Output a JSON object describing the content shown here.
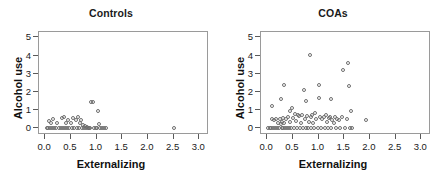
{
  "figure": {
    "background": "#ffffff",
    "marker_color": "#6e6e6e",
    "axis_color": "#9a9a9a"
  },
  "chart_data": [
    {
      "type": "scatter",
      "title": "Controls",
      "xlabel": "Externalizing",
      "ylabel": "Alcohol use",
      "xlim": [
        -0.12,
        3.15
      ],
      "ylim": [
        -0.28,
        5.3
      ],
      "xticks": [
        "0.0",
        "0.5",
        "1.0",
        "1.5",
        "2.0",
        "2.5",
        "3.0"
      ],
      "xtick_values": [
        0.0,
        0.5,
        1.0,
        1.5,
        2.0,
        2.5,
        3.0
      ],
      "yticks": [
        "0",
        "1",
        "2",
        "3",
        "4",
        "5"
      ],
      "ytick_values": [
        0,
        1,
        2,
        3,
        4,
        5
      ],
      "grid": false,
      "legend": "none",
      "marker": "open-circle",
      "points": [
        [
          0.03,
          0.0
        ],
        [
          0.06,
          0.0
        ],
        [
          0.08,
          0.4
        ],
        [
          0.09,
          0.0
        ],
        [
          0.12,
          0.3
        ],
        [
          0.14,
          0.0
        ],
        [
          0.16,
          0.52
        ],
        [
          0.18,
          0.0
        ],
        [
          0.21,
          0.0
        ],
        [
          0.24,
          0.3
        ],
        [
          0.26,
          0.0
        ],
        [
          0.3,
          0.0
        ],
        [
          0.32,
          0.55
        ],
        [
          0.34,
          0.0
        ],
        [
          0.36,
          0.62
        ],
        [
          0.38,
          0.0
        ],
        [
          0.4,
          0.28
        ],
        [
          0.42,
          0.0
        ],
        [
          0.45,
          0.45
        ],
        [
          0.47,
          0.0
        ],
        [
          0.5,
          0.3
        ],
        [
          0.52,
          0.0
        ],
        [
          0.55,
          0.55
        ],
        [
          0.57,
          0.0
        ],
        [
          0.6,
          0.42
        ],
        [
          0.62,
          0.0
        ],
        [
          0.64,
          0.62
        ],
        [
          0.66,
          0.0
        ],
        [
          0.68,
          0.3
        ],
        [
          0.7,
          0.45
        ],
        [
          0.72,
          0.0
        ],
        [
          0.74,
          0.18
        ],
        [
          0.76,
          0.0
        ],
        [
          0.78,
          0.1
        ],
        [
          0.8,
          0.0
        ],
        [
          0.82,
          0.05
        ],
        [
          0.84,
          0.0
        ],
        [
          0.86,
          0.0
        ],
        [
          0.88,
          0.0
        ],
        [
          0.9,
          1.42
        ],
        [
          0.93,
          1.42
        ],
        [
          0.95,
          0.0
        ],
        [
          0.98,
          0.0
        ],
        [
          1.0,
          0.0
        ],
        [
          1.03,
          0.92
        ],
        [
          1.05,
          0.2
        ],
        [
          1.07,
          0.0
        ],
        [
          1.1,
          0.0
        ],
        [
          1.14,
          0.0
        ],
        [
          1.18,
          0.0
        ],
        [
          2.5,
          0.0
        ]
      ]
    },
    {
      "type": "scatter",
      "title": "COAs",
      "xlabel": "Externalizing",
      "ylabel": "Alcohol use",
      "xlim": [
        -0.12,
        3.15
      ],
      "ylim": [
        -0.28,
        5.3
      ],
      "xticks": [
        "0.0",
        "0.5",
        "1.0",
        "1.5",
        "2.0",
        "2.5",
        "3.0"
      ],
      "xtick_values": [
        0.0,
        0.5,
        1.0,
        1.5,
        2.0,
        2.5,
        3.0
      ],
      "yticks": [
        "0",
        "1",
        "2",
        "3",
        "4",
        "5"
      ],
      "ytick_values": [
        0,
        1,
        2,
        3,
        4,
        5
      ],
      "grid": false,
      "legend": "none",
      "marker": "open-circle",
      "points": [
        [
          0.02,
          0.0
        ],
        [
          0.05,
          0.0
        ],
        [
          0.07,
          0.0
        ],
        [
          0.09,
          1.22
        ],
        [
          0.1,
          0.48
        ],
        [
          0.12,
          0.0
        ],
        [
          0.14,
          0.45
        ],
        [
          0.16,
          0.0
        ],
        [
          0.18,
          0.5
        ],
        [
          0.2,
          0.0
        ],
        [
          0.22,
          0.3
        ],
        [
          0.23,
          0.0
        ],
        [
          0.25,
          0.48
        ],
        [
          0.26,
          1.6
        ],
        [
          0.27,
          0.2
        ],
        [
          0.28,
          0.0
        ],
        [
          0.29,
          0.35
        ],
        [
          0.3,
          0.0
        ],
        [
          0.31,
          0.55
        ],
        [
          0.32,
          0.25
        ],
        [
          0.33,
          2.35
        ],
        [
          0.34,
          0.0
        ],
        [
          0.36,
          0.48
        ],
        [
          0.38,
          0.0
        ],
        [
          0.4,
          0.6
        ],
        [
          0.42,
          0.0
        ],
        [
          0.44,
          0.95
        ],
        [
          0.45,
          0.32
        ],
        [
          0.47,
          0.0
        ],
        [
          0.48,
          1.08
        ],
        [
          0.5,
          0.55
        ],
        [
          0.52,
          0.0
        ],
        [
          0.54,
          0.75
        ],
        [
          0.56,
          0.4
        ],
        [
          0.58,
          0.0
        ],
        [
          0.6,
          0.7
        ],
        [
          0.62,
          0.68
        ],
        [
          0.64,
          0.0
        ],
        [
          0.66,
          0.3
        ],
        [
          0.68,
          0.72
        ],
        [
          0.7,
          0.0
        ],
        [
          0.72,
          2.12
        ],
        [
          0.73,
          0.52
        ],
        [
          0.75,
          0.0
        ],
        [
          0.76,
          1.48
        ],
        [
          0.78,
          0.65
        ],
        [
          0.8,
          0.0
        ],
        [
          0.82,
          0.35
        ],
        [
          0.84,
          4.05
        ],
        [
          0.85,
          0.62
        ],
        [
          0.86,
          0.0
        ],
        [
          0.88,
          0.72
        ],
        [
          0.9,
          0.3
        ],
        [
          0.92,
          0.0
        ],
        [
          0.94,
          0.85
        ],
        [
          0.96,
          0.52
        ],
        [
          0.98,
          0.0
        ],
        [
          1.0,
          2.38
        ],
        [
          1.01,
          1.68
        ],
        [
          1.03,
          0.62
        ],
        [
          1.05,
          0.0
        ],
        [
          1.07,
          0.48
        ],
        [
          1.1,
          0.58
        ],
        [
          1.12,
          0.0
        ],
        [
          1.14,
          0.72
        ],
        [
          1.16,
          0.35
        ],
        [
          1.18,
          0.0
        ],
        [
          1.2,
          0.55
        ],
        [
          1.22,
          0.62
        ],
        [
          1.24,
          1.6
        ],
        [
          1.25,
          0.0
        ],
        [
          1.27,
          0.45
        ],
        [
          1.3,
          0.3
        ],
        [
          1.32,
          0.62
        ],
        [
          1.34,
          0.0
        ],
        [
          1.36,
          0.5
        ],
        [
          1.4,
          0.45
        ],
        [
          1.42,
          0.0
        ],
        [
          1.45,
          0.62
        ],
        [
          1.48,
          3.22
        ],
        [
          1.52,
          0.0
        ],
        [
          1.55,
          0.48
        ],
        [
          1.58,
          3.6
        ],
        [
          1.6,
          2.32
        ],
        [
          1.62,
          0.0
        ],
        [
          1.64,
          0.95
        ],
        [
          1.66,
          0.0
        ],
        [
          1.92,
          0.45
        ]
      ]
    }
  ]
}
